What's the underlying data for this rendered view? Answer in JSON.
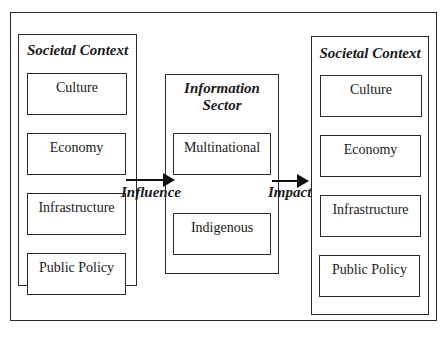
{
  "diagram": {
    "left_panel": {
      "title": "Societal Context",
      "items": [
        "Culture",
        "Economy",
        "Infrastructure",
        "Public Policy"
      ]
    },
    "center_panel": {
      "title_line1": "Information",
      "title_line2": "Sector",
      "items": [
        "Multinational",
        "Indigenous"
      ]
    },
    "right_panel": {
      "title": "Societal Context",
      "items": [
        "Culture",
        "Economy",
        "Infrastructure",
        "Public Policy"
      ]
    },
    "arrows": {
      "left_to_center": "Influence",
      "center_to_right": "Impact"
    }
  }
}
